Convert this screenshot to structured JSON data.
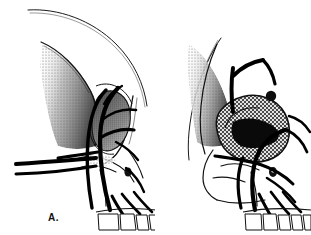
{
  "figure": {
    "type": "anatomical-line-illustration",
    "background_color": "#ffffff",
    "ink_color": "#000000",
    "panel_count": 2
  },
  "panels": [
    {
      "id": "A",
      "label": "A.",
      "caption_position": "bottom-left",
      "description": "normal lateral skull with open orbit and branching facial arteries",
      "orbit_fill": "stippled-dark",
      "has_mass": false,
      "features": [
        "cranial vault outline",
        "frontal bone with stipple shading",
        "temporal line gradient",
        "orbital rim",
        "orbit cavity stippled",
        "zygomatic arch",
        "nasal bone",
        "infraorbital foramen",
        "maxilla",
        "upper teeth row",
        "supraorbital artery",
        "facial artery branches",
        "horizontal nasal vessels"
      ]
    },
    {
      "id": "B",
      "label": "B.",
      "caption_position": "bottom-left",
      "description": "lateral skull with cross-hatched tumor mass filling the orbit",
      "orbit_fill": "cross-hatched-mass",
      "has_mass": true,
      "features": [
        "frontal bone outline",
        "temporal shading",
        "orbital tumor mass cross-hatched",
        "vessel bifurcation above orbit",
        "infraorbital foramen",
        "maxilla",
        "upper teeth row",
        "facial artery branches"
      ]
    }
  ],
  "colors": {
    "ink": "#000000",
    "background": "#ffffff",
    "shade_light": "#c9c9c9",
    "shade_mid": "#9a9a9a",
    "shade_dark": "#6a6a6a",
    "label_text": "#111111"
  }
}
